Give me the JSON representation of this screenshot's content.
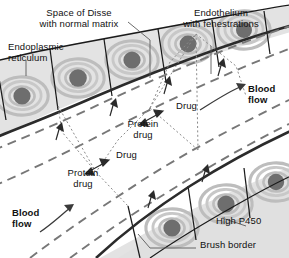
{
  "figure": {
    "background_color": "#ffffff"
  },
  "colors": {
    "cytoplasm": "#e3e3e3",
    "cytoplasm_alt": "#dcdcdc",
    "er_swirl": "#bdbdbd",
    "er_swirl_light": "#cfcfcf",
    "nucleus": "#6e6e6e",
    "cell_outline": "#1a1a1a",
    "sinusoid_dashed": "#777777",
    "dotted_drug": "#8a8a8a",
    "leader_line": "#5a5a5a",
    "text": "#111111"
  },
  "labels": {
    "space_of_disse": "Space of Disse\nwith normal matrix",
    "endothelium": "Endothelium\nwith fenestrations",
    "endoplasmic_reticulum": "Endoplasmic\nreticulum",
    "blood_flow_top": "Blood\nflow",
    "blood_flow_bottom": "Blood\nflow",
    "drug_upper": "Drug",
    "drug_lower": "Drug",
    "protein_drug_upper": "Protein\ndrug",
    "protein_drug_lower": "Protein\ndrug",
    "high_p450": "High P450",
    "brush_border": "Brush border"
  },
  "icons": {
    "arrow_blood_flow": "curved-arrow-icon",
    "arrow_drug_exchange": "double-headed-arrow-icon",
    "arrow_uptake": "triangle-arrowhead-icon",
    "leader": "leader-line-icon"
  }
}
